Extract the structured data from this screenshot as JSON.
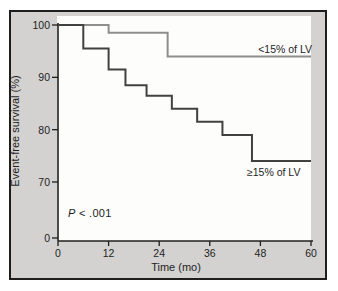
{
  "colors": {
    "figure_background": "#d3d2d0",
    "panel_background": "#fdfdfc",
    "ink": "#1e1e1e",
    "curve_lt15": "#8e8e8e",
    "curve_ge15": "#414141"
  },
  "chart_data": {
    "type": "line",
    "subtype": "kaplan_meier_step",
    "title": "",
    "xlabel": "Time (mo)",
    "ylabel": "Event-free survival (%)",
    "xlim": [
      0,
      60
    ],
    "x_ticks": [
      0,
      12,
      24,
      36,
      48,
      60
    ],
    "y_ticks": [
      100,
      90,
      80,
      70,
      0
    ],
    "y_axis_break_between": [
      70,
      0
    ],
    "grid": false,
    "legend_position": "on-curve",
    "annotation": {
      "symbol_italic": "P",
      "rest": " < .001"
    },
    "series": [
      {
        "name": "<15% of LV",
        "color": "#8e8e8e",
        "event_times_mo": [
          0,
          12,
          26
        ],
        "survival_pct": [
          100,
          98.5,
          94
        ],
        "end_mo": 60
      },
      {
        "name": "≥15% of LV",
        "color": "#414141",
        "event_times_mo": [
          0,
          6,
          12,
          16,
          21,
          27,
          33,
          39,
          46
        ],
        "survival_pct": [
          100,
          95.5,
          91.5,
          88.5,
          86.5,
          84,
          81.5,
          79,
          74
        ],
        "end_mo": 60
      }
    ]
  }
}
